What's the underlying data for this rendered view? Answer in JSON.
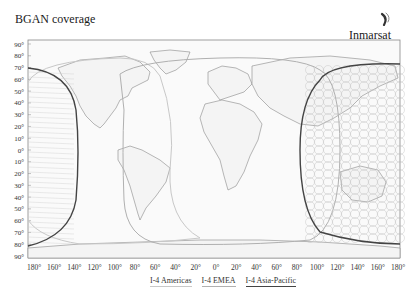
{
  "header": {
    "title": "BGAN coverage",
    "brand": "Inmarsat",
    "logo_icon": "inmarsat-swoosh-icon"
  },
  "map": {
    "projection": "equirectangular",
    "lat_labels": [
      "90°",
      "80°",
      "70°",
      "60°",
      "50°",
      "40°",
      "30°",
      "20°",
      "10°",
      "0°",
      "10°",
      "20°",
      "30°",
      "40°",
      "50°",
      "60°",
      "70°",
      "80°",
      "90°"
    ],
    "lon_labels": [
      "180°",
      "160°",
      "140°",
      "120°",
      "100°",
      "80°",
      "60°",
      "40°",
      "20°",
      "0°",
      "20°",
      "40°",
      "60°",
      "80°",
      "100°",
      "120°",
      "140°",
      "160°",
      "180°"
    ],
    "regions": [
      {
        "name": "I-4 Americas",
        "color": "#c8c8c8"
      },
      {
        "name": "I-4 EMEA",
        "color": "#b0b0b0"
      },
      {
        "name": "I-4 Asia-Pacific",
        "color": "#444444"
      }
    ]
  },
  "legend": {
    "items": [
      "I-4 Americas",
      "I-4 EMEA",
      "I-4 Asia-Pacific"
    ]
  }
}
